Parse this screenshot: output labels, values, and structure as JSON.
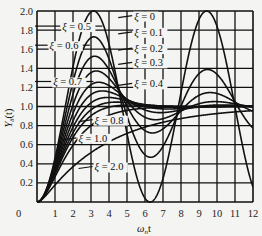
{
  "chart_data": {
    "type": "line",
    "title": "",
    "xlabel": "ω_n t",
    "ylabel": "Y_δ(t)",
    "xlim": [
      0,
      12
    ],
    "ylim": [
      0,
      2.0
    ],
    "grid": true,
    "x_ticks": [
      "0",
      "1",
      "2",
      "3",
      "4",
      "5",
      "6",
      "7",
      "8",
      "9",
      "10",
      "11",
      "12"
    ],
    "y_ticks": [
      "0.2",
      "0.4",
      "0.6",
      "0.8",
      "1.0",
      "1.2",
      "1.4",
      "1.6",
      "1.8",
      "2.0"
    ],
    "formula": "Y(t) = 1 - e^(-ξ ω_n t) (cos(ω_d t) + ξ/√(1-ξ²) sin(ω_d t)), ω_d = ω_n √(1-ξ²)",
    "series": [
      {
        "name": "ξ=0",
        "xi": 0.0,
        "label": "ξ = 0"
      },
      {
        "name": "ξ=0.1",
        "xi": 0.1,
        "label": "ξ = 0.1"
      },
      {
        "name": "ξ=0.2",
        "xi": 0.2,
        "label": "ξ = 0.2"
      },
      {
        "name": "ξ=0.3",
        "xi": 0.3,
        "label": "ξ = 0.3"
      },
      {
        "name": "ξ=0.4",
        "xi": 0.4,
        "label": "ξ = 0.4"
      },
      {
        "name": "ξ=0.5",
        "xi": 0.5,
        "label": "ξ = 0.5"
      },
      {
        "name": "ξ=0.6",
        "xi": 0.6,
        "label": "ξ = 0.6"
      },
      {
        "name": "ξ=0.7",
        "xi": 0.7,
        "label": "ξ = 0.7"
      },
      {
        "name": "ξ=0.8",
        "xi": 0.8,
        "label": "ξ = 0.8"
      },
      {
        "name": "ξ=1.0",
        "xi": 1.0,
        "label": "ξ = 1.0"
      },
      {
        "name": "ξ=2.0",
        "xi": 2.0,
        "label": "ξ = 2.0"
      }
    ],
    "peak_values": {
      "ξ=0": 2.0,
      "ξ=0.1": 1.73,
      "ξ=0.2": 1.53,
      "ξ=0.3": 1.37,
      "ξ=0.4": 1.25,
      "ξ=0.5": 1.16,
      "ξ=0.6": 1.09,
      "ξ=0.7": 1.05,
      "ξ=0.8": 1.02,
      "ξ=1.0": 1.0,
      "ξ=2.0": 1.0
    },
    "annotations": [
      {
        "text": "ξ = 0.5",
        "x": 1.4,
        "y": 1.8,
        "side": "left"
      },
      {
        "text": "ξ = 0.6",
        "x": 0.7,
        "y": 1.6,
        "side": "left"
      },
      {
        "text": "ξ = 0.7",
        "x": 0.9,
        "y": 1.22,
        "side": "left"
      },
      {
        "text": "ξ = 0",
        "x": 5.4,
        "y": 1.91,
        "side": "right"
      },
      {
        "text": "ξ = 0.1",
        "x": 5.4,
        "y": 1.74,
        "side": "right"
      },
      {
        "text": "ξ = 0.2",
        "x": 5.4,
        "y": 1.57,
        "side": "right"
      },
      {
        "text": "ξ = 0.3",
        "x": 5.4,
        "y": 1.42,
        "side": "right"
      },
      {
        "text": "ξ = 0.4",
        "x": 5.4,
        "y": 1.2,
        "side": "right"
      },
      {
        "text": "ξ = 0.8",
        "x": 3.2,
        "y": 0.82,
        "side": "right"
      },
      {
        "text": "ξ = 1.0",
        "x": 2.3,
        "y": 0.63,
        "side": "right"
      },
      {
        "text": "ξ = 2.0",
        "x": 3.2,
        "y": 0.33,
        "side": "right"
      }
    ]
  },
  "axes": {
    "origin_label": "0",
    "x_title": "ω",
    "x_title_sub": "n",
    "x_title_suffix": "t",
    "y_title": "Y",
    "y_title_sub": "δ",
    "y_title_suffix": "(t)"
  }
}
